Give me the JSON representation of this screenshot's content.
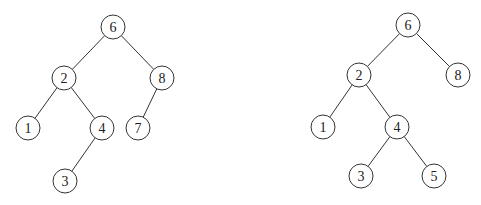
{
  "style": {
    "stroke_color": "#333333",
    "fill_color": "#ffffff",
    "text_color": "#222222",
    "node_radius": 12
  },
  "trees": [
    {
      "name": "left-tree",
      "nodes": [
        {
          "id": "L6",
          "label": "6",
          "x": 113,
          "y": 27
        },
        {
          "id": "L2",
          "label": "2",
          "x": 64,
          "y": 78
        },
        {
          "id": "L8",
          "label": "8",
          "x": 162,
          "y": 78
        },
        {
          "id": "L1",
          "label": "1",
          "x": 28,
          "y": 128
        },
        {
          "id": "L4",
          "label": "4",
          "x": 102,
          "y": 128
        },
        {
          "id": "L7",
          "label": "7",
          "x": 138,
          "y": 128
        },
        {
          "id": "L3",
          "label": "3",
          "x": 65,
          "y": 181
        }
      ],
      "edges": [
        [
          "L6",
          "L2"
        ],
        [
          "L6",
          "L8"
        ],
        [
          "L2",
          "L1"
        ],
        [
          "L2",
          "L4"
        ],
        [
          "L8",
          "L7"
        ],
        [
          "L4",
          "L3"
        ]
      ]
    },
    {
      "name": "right-tree",
      "nodes": [
        {
          "id": "R6",
          "label": "6",
          "x": 408,
          "y": 25
        },
        {
          "id": "R2",
          "label": "2",
          "x": 359,
          "y": 75
        },
        {
          "id": "R8",
          "label": "8",
          "x": 458,
          "y": 75
        },
        {
          "id": "R1",
          "label": "1",
          "x": 323,
          "y": 127
        },
        {
          "id": "R4",
          "label": "4",
          "x": 397,
          "y": 127
        },
        {
          "id": "R3",
          "label": "3",
          "x": 361,
          "y": 176
        },
        {
          "id": "R5",
          "label": "5",
          "x": 434,
          "y": 176
        }
      ],
      "edges": [
        [
          "R6",
          "R2"
        ],
        [
          "R6",
          "R8"
        ],
        [
          "R2",
          "R1"
        ],
        [
          "R2",
          "R4"
        ],
        [
          "R4",
          "R3"
        ],
        [
          "R4",
          "R5"
        ]
      ]
    }
  ]
}
